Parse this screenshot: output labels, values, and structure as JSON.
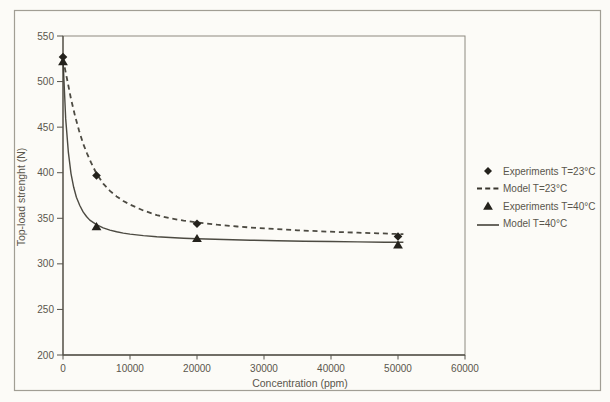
{
  "chart_data": {
    "type": "line",
    "title": "",
    "xlabel": "Concentration (ppm)",
    "ylabel": "Top-load strenght (N)",
    "xlim": [
      0,
      60000
    ],
    "ylim": [
      200,
      550
    ],
    "x_ticks": [
      0,
      10000,
      20000,
      30000,
      40000,
      50000,
      60000
    ],
    "y_ticks": [
      550,
      500,
      450,
      400,
      350,
      300,
      250,
      200
    ],
    "grid": false,
    "legend_position": "right-outside",
    "legend": [
      {
        "label": "Experiments T=23°C",
        "icon": "diamond-marker-icon"
      },
      {
        "label": "Model T=23°C",
        "icon": "dashed-line-icon"
      },
      {
        "label": "Experiments T=40°C",
        "icon": "triangle-marker-icon"
      },
      {
        "label": "Model T=40°C",
        "icon": "solid-line-icon"
      }
    ],
    "series": [
      {
        "name": "Experiments T=23°C",
        "type": "scatter",
        "marker": "diamond",
        "x": [
          0,
          5000,
          20000,
          50000
        ],
        "y": [
          527,
          397,
          344,
          330
        ]
      },
      {
        "name": "Model T=23°C",
        "type": "line",
        "style": "dashed",
        "points": [
          [
            0,
            525
          ],
          [
            600,
            503
          ],
          [
            1200,
            481
          ],
          [
            1800,
            462
          ],
          [
            2400,
            446
          ],
          [
            3000,
            432
          ],
          [
            3600,
            421
          ],
          [
            4200,
            411
          ],
          [
            5000,
            399
          ],
          [
            6000,
            388
          ],
          [
            7000,
            380
          ],
          [
            8000,
            374
          ],
          [
            9000,
            369
          ],
          [
            10000,
            365
          ],
          [
            12000,
            358.5
          ],
          [
            14000,
            353.5
          ],
          [
            16000,
            350
          ],
          [
            18000,
            347.5
          ],
          [
            20000,
            345.5
          ],
          [
            23000,
            343
          ],
          [
            26000,
            341
          ],
          [
            29000,
            339.3
          ],
          [
            32000,
            338
          ],
          [
            35000,
            336.8
          ],
          [
            38000,
            335.8
          ],
          [
            41000,
            335
          ],
          [
            44000,
            334.2
          ],
          [
            47000,
            333.5
          ],
          [
            50800,
            332.5
          ]
        ]
      },
      {
        "name": "Experiments T=40°C",
        "type": "scatter",
        "marker": "triangle",
        "x": [
          0,
          5000,
          20000,
          50000
        ],
        "y": [
          522,
          341,
          328,
          321
        ]
      },
      {
        "name": "Model T=40°C",
        "type": "line",
        "style": "solid",
        "points": [
          [
            0,
            525
          ],
          [
            400,
            459
          ],
          [
            800,
            422
          ],
          [
            1200,
            399
          ],
          [
            1600,
            384
          ],
          [
            2000,
            373
          ],
          [
            2500,
            364
          ],
          [
            3000,
            357
          ],
          [
            3500,
            352
          ],
          [
            4000,
            348
          ],
          [
            5000,
            343
          ],
          [
            6000,
            339.5
          ],
          [
            7000,
            337
          ],
          [
            8000,
            335.2
          ],
          [
            9000,
            333.8
          ],
          [
            10000,
            332.7
          ],
          [
            12000,
            331
          ],
          [
            14000,
            329.8
          ],
          [
            16000,
            328.9
          ],
          [
            18000,
            328.2
          ],
          [
            20000,
            327.6
          ],
          [
            24000,
            326.7
          ],
          [
            28000,
            326
          ],
          [
            32000,
            325.4
          ],
          [
            36000,
            324.9
          ],
          [
            40000,
            324.5
          ],
          [
            44000,
            324.1
          ],
          [
            48000,
            323.8
          ],
          [
            50800,
            323.6
          ]
        ]
      }
    ]
  },
  "colors": {
    "ink": "#39362e",
    "marker": "#24221c",
    "text": "#5a564c",
    "axis": "#55524a",
    "frame_border": "#a19e94",
    "paper": "#fcfbf7"
  }
}
